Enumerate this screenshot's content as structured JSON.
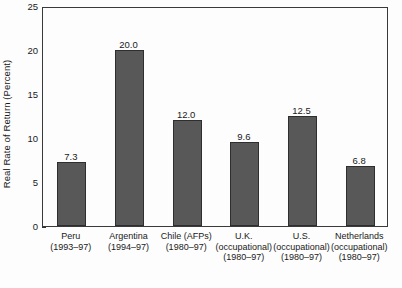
{
  "chart_data": {
    "type": "bar",
    "title": "",
    "xlabel": "",
    "ylabel": "Real Rate of Return (Percent)",
    "ylim": [
      0,
      25
    ],
    "ytick_values": [
      25,
      20,
      15,
      10,
      5,
      0
    ],
    "ytick_labels": [
      "25",
      "20",
      "15",
      "10",
      "5",
      "0"
    ],
    "grid": false,
    "legend": null,
    "categories": [
      "Peru (1993–97)",
      "Argentina (1994–97)",
      "Chile (AFPs) (1980–97)",
      "U.K. (occupational) (1980–97)",
      "U.S. (occupational) (1980–97)",
      "Netherlands (occupational) (1980–97)"
    ],
    "category_lines": [
      [
        "Peru",
        "(1993–97)"
      ],
      [
        "Argentina",
        "(1994–97)"
      ],
      [
        "Chile (AFPs)",
        "(1980–97)"
      ],
      [
        "U.K.",
        "(occupational)",
        "(1980–97)"
      ],
      [
        "U.S.",
        "(occupational)",
        "(1980–97)"
      ],
      [
        "Netherlands",
        "(occupational)",
        "(1980–97)"
      ]
    ],
    "values": [
      7.3,
      20.0,
      12.0,
      9.6,
      12.5,
      6.8
    ],
    "value_labels": [
      "7.3",
      "20.0",
      "12.0",
      "9.6",
      "12.5",
      "6.8"
    ],
    "bar_color": "#585858",
    "frame_color": "#3a3a3a",
    "background_color": "#fdfdfd"
  }
}
